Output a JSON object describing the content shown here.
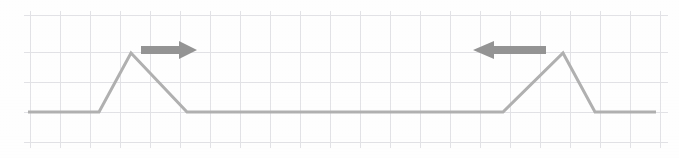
{
  "figure": {
    "width": 679,
    "height": 158,
    "background_color": "#fefefe"
  },
  "grid": {
    "color": "#e2e2e6",
    "line_width": 1,
    "cell_width": 30,
    "cell_height": 30,
    "x_positions": [
      30,
      60,
      90,
      120,
      150,
      180,
      210,
      240,
      270,
      300,
      330,
      360,
      390,
      420,
      450,
      480,
      510,
      540,
      570,
      600,
      630,
      660
    ],
    "y_positions": [
      15,
      45,
      52,
      82,
      112,
      142
    ],
    "vertical_lines": [
      30,
      60,
      90,
      120,
      150,
      180,
      210,
      240,
      270,
      300,
      330,
      360,
      390,
      420,
      450,
      480,
      510,
      540,
      570,
      600,
      630,
      660
    ],
    "horizontal_lines": [
      15,
      52,
      82,
      112,
      142
    ],
    "top": 15,
    "bottom": 142,
    "left": 30,
    "right": 660
  },
  "waveform": {
    "label": "signal-trace",
    "color": "#b0b0b0",
    "stroke_width": 3,
    "baseline_y": 112,
    "peak_y": 53,
    "points": "28,112 99,112 131,53 187,112 503,112 563,53 595,112 656,112",
    "vertices": [
      {
        "x": 28,
        "y": 112,
        "name": "trace-start"
      },
      {
        "x": 99,
        "y": 112,
        "name": "pulse1-rise-start"
      },
      {
        "x": 131,
        "y": 53,
        "name": "pulse1-peak"
      },
      {
        "x": 187,
        "y": 112,
        "name": "pulse1-fall-end"
      },
      {
        "x": 503,
        "y": 112,
        "name": "pulse2-rise-start"
      },
      {
        "x": 563,
        "y": 53,
        "name": "pulse2-peak"
      },
      {
        "x": 595,
        "y": 112,
        "name": "pulse2-fall-end"
      },
      {
        "x": 656,
        "y": 112,
        "name": "trace-end"
      }
    ]
  },
  "chart_data": {
    "type": "line",
    "xlabel": "",
    "ylabel": "",
    "grid": true,
    "legend": "none",
    "xlim": [
      0,
      679
    ],
    "ylim": [
      158,
      0
    ],
    "series": [
      {
        "name": "signal-trace",
        "color": "#b0b0b0",
        "x": [
          28,
          99,
          131,
          187,
          503,
          563,
          595,
          656
        ],
        "y": [
          112,
          112,
          53,
          112,
          112,
          53,
          112,
          112
        ]
      }
    ],
    "annotations": [
      {
        "name": "right-arrow",
        "type": "arrow",
        "direction": "right",
        "x_start": 141,
        "x_end": 196,
        "y": 50,
        "color": "#949494"
      },
      {
        "name": "left-arrow",
        "type": "arrow",
        "direction": "left",
        "x_start": 546,
        "x_end": 473,
        "y": 50,
        "color": "#949494"
      }
    ]
  },
  "arrows": [
    {
      "name": "right-arrow",
      "direction": "right",
      "color": "#949494",
      "shaft_start_x": 141,
      "shaft_end_x": 179,
      "tip_x": 197,
      "center_y": 50,
      "shaft_half_height": 4,
      "head_half_height": 9,
      "polygon": "141,46 179,46 179,41 197,50 179,59 179,54 141,54"
    },
    {
      "name": "left-arrow",
      "direction": "left",
      "color": "#949494",
      "shaft_start_x": 546,
      "shaft_end_x": 494,
      "tip_x": 473,
      "center_y": 50,
      "shaft_half_height": 4,
      "head_half_height": 9,
      "polygon": "546,46 494,46 494,41 473,50 494,59 494,54 546,54"
    }
  ]
}
